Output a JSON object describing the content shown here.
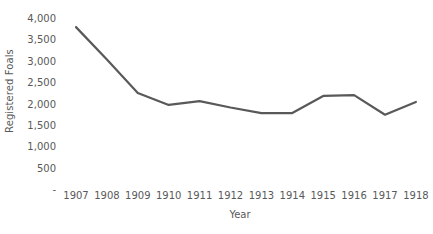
{
  "chart_data": {
    "type": "line",
    "title": "",
    "xlabel": "Year",
    "ylabel": "Registered Foals",
    "categories": [
      "1907",
      "1908",
      "1909",
      "1910",
      "1911",
      "1912",
      "1913",
      "1914",
      "1915",
      "1916",
      "1917",
      "1918"
    ],
    "x": [
      1907,
      1908,
      1909,
      1910,
      1911,
      1912,
      1913,
      1914,
      1915,
      1916,
      1917,
      1918
    ],
    "values": [
      3810,
      3050,
      2270,
      1990,
      2080,
      1930,
      1800,
      1800,
      2200,
      2220,
      1760,
      2060
    ],
    "series": [
      {
        "name": "Registered Foals",
        "color": "#595959",
        "values": [
          3810,
          3050,
          2270,
          1990,
          2080,
          1930,
          1800,
          1800,
          2200,
          2220,
          1760,
          2060
        ]
      }
    ],
    "ylim": [
      0,
      4000
    ],
    "ytick_values": [
      0,
      500,
      1000,
      1500,
      2000,
      2500,
      3000,
      3500,
      4000
    ],
    "ytick_labels": [
      "-",
      "500",
      "1,000",
      "1,500",
      "2,000",
      "2,500",
      "3,000",
      "3,500",
      "4,000"
    ],
    "xtick_labels": [
      "1907",
      "1908",
      "1909",
      "1910",
      "1911",
      "1912",
      "1913",
      "1914",
      "1915",
      "1916",
      "1917",
      "1918"
    ],
    "grid": false,
    "legend": "none",
    "line_color": "#595959",
    "line_width": 2.2,
    "markers": false,
    "background": "#ffffff",
    "text_color": "#595959"
  }
}
